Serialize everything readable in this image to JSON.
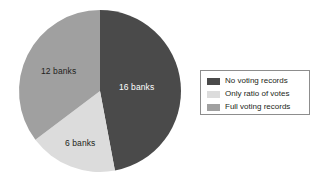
{
  "chart_data": {
    "type": "pie",
    "title": "",
    "unit": "banks",
    "total": 34,
    "categories": [
      "No voting records",
      "Only ratio of votes",
      "Full voting records"
    ],
    "values": [
      16,
      6,
      12
    ],
    "data_labels": [
      "16 banks",
      "6 banks",
      "12 banks"
    ],
    "percentages": [
      47.06,
      17.65,
      35.29
    ],
    "start_angle_deg": 0,
    "direction": "clockwise",
    "colors": [
      "#4a4a4a",
      "#dcdcdc",
      "#a0a0a0"
    ],
    "legend": {
      "position": "right",
      "bordered": true,
      "entries": [
        {
          "label": "No voting records",
          "color": "#4a4a4a"
        },
        {
          "label": "Only ratio of votes",
          "color": "#dcdcdc"
        },
        {
          "label": "Full voting records",
          "color": "#a0a0a0"
        }
      ]
    },
    "slices": [
      {
        "label": "No voting records",
        "value": 16,
        "data_label": "16 banks",
        "color": "#4a4a4a",
        "label_color": "#ffffff"
      },
      {
        "label": "Only ratio of votes",
        "value": 6,
        "data_label": "6 banks",
        "color": "#dcdcdc",
        "label_color": "#231f20"
      },
      {
        "label": "Full voting records",
        "value": 12,
        "data_label": "12 banks",
        "color": "#a0a0a0",
        "label_color": "#231f20"
      }
    ],
    "grid": false,
    "xlabel": "",
    "ylabel": ""
  },
  "geometry": {
    "center_x": 100,
    "center_y": 91,
    "radius": 81
  }
}
